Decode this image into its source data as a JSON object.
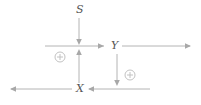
{
  "diagram": {
    "type": "signal-flow-diagram",
    "background_color": "#ffffff",
    "line_color": "#b4b4b4",
    "label_color": "#555555",
    "junction_color": "#c2c2c2",
    "nodes": [
      {
        "id": "s",
        "label": "S",
        "x": 79,
        "y": 10
      },
      {
        "id": "y",
        "label": "Y",
        "x": 113,
        "y": 46
      },
      {
        "id": "x",
        "label": "X",
        "x": 79,
        "y": 89
      }
    ],
    "junctions": [
      {
        "id": "sum-left",
        "symbol": "+",
        "x": 60,
        "y": 57,
        "radius": 5
      },
      {
        "id": "sum-right",
        "symbol": "+",
        "x": 130,
        "y": 75,
        "radius": 5
      }
    ],
    "edges": [
      {
        "id": "s-down",
        "from": "S",
        "to": "middle-line",
        "direction": "down"
      },
      {
        "id": "middle-to-y",
        "from": "middle-left",
        "to": "Y",
        "direction": "right"
      },
      {
        "id": "y-to-right",
        "from": "Y",
        "to": "middle-right-end",
        "direction": "right"
      },
      {
        "id": "y-down",
        "from": "Y",
        "to": "bottom-line",
        "direction": "down"
      },
      {
        "id": "bottom-to-x",
        "from": "bottom-right",
        "to": "X",
        "direction": "left"
      },
      {
        "id": "x-to-left",
        "from": "X",
        "to": "bottom-left-end",
        "direction": "left"
      },
      {
        "id": "x-up",
        "from": "X",
        "to": "middle-line",
        "direction": "up"
      }
    ]
  }
}
